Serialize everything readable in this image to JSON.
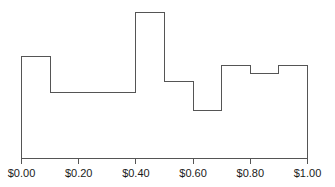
{
  "chart_data": {
    "type": "bar",
    "title": "",
    "subtitle": "",
    "xlabel": "",
    "ylabel": "",
    "categories": [
      "$0.00-$0.10",
      "$0.10-$0.20",
      "$0.20-$0.30",
      "$0.30-$0.40",
      "$0.40-$0.50",
      "$0.50-$0.60",
      "$0.60-$0.70",
      "$0.70-$0.80",
      "$0.80-$0.90",
      "$0.90-$1.00"
    ],
    "bin_edges": [
      0.0,
      0.1,
      0.2,
      0.3,
      0.4,
      0.5,
      0.6,
      0.7,
      0.8,
      0.9,
      1.0
    ],
    "values": [
      0.7,
      0.45,
      0.45,
      0.45,
      1.0,
      0.53,
      0.33,
      0.64,
      0.58,
      0.64
    ],
    "xlim": [
      0.0,
      1.0
    ],
    "ylim": [
      0.0,
      1.0
    ],
    "xtick_values": [
      0.0,
      0.2,
      0.4,
      0.6,
      0.8,
      1.0
    ],
    "xtick_labels": [
      "$0.00",
      "$0.20",
      "$0.40",
      "$0.60",
      "$0.80",
      "$1.00"
    ],
    "ytick_labels": [],
    "grid": false,
    "legend": [],
    "legend_position": "none",
    "annotations": [],
    "style": {
      "line_color": "#555555",
      "fill_color": "none",
      "axis_color": "#555555",
      "tick_label_color": "#1a1a1a",
      "background_color": "#ffffff",
      "line_width": 1
    }
  }
}
